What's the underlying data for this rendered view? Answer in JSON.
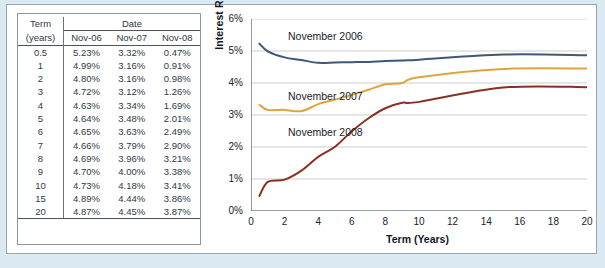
{
  "table": {
    "header": {
      "term": "Term",
      "term_units": "(years)",
      "group": "Date",
      "columns": [
        "Nov-06",
        "Nov-07",
        "Nov-08"
      ]
    },
    "rows": [
      {
        "term": "0.5",
        "nov06": "5.23%",
        "nov07": "3.32%",
        "nov08": "0.47%"
      },
      {
        "term": "1",
        "nov06": "4.99%",
        "nov07": "3.16%",
        "nov08": "0.91%"
      },
      {
        "term": "2",
        "nov06": "4.80%",
        "nov07": "3.16%",
        "nov08": "0.98%"
      },
      {
        "term": "3",
        "nov06": "4.72%",
        "nov07": "3.12%",
        "nov08": "1.26%"
      },
      {
        "term": "4",
        "nov06": "4.63%",
        "nov07": "3.34%",
        "nov08": "1.69%"
      },
      {
        "term": "5",
        "nov06": "4.64%",
        "nov07": "3.48%",
        "nov08": "2.01%"
      },
      {
        "term": "6",
        "nov06": "4.65%",
        "nov07": "3.63%",
        "nov08": "2.49%"
      },
      {
        "term": "7",
        "nov06": "4.66%",
        "nov07": "3.79%",
        "nov08": "2.90%"
      },
      {
        "term": "8",
        "nov06": "4.69%",
        "nov07": "3.96%",
        "nov08": "3.21%"
      },
      {
        "term": "9",
        "nov06": "4.70%",
        "nov07": "4.00%",
        "nov08": "3.38%"
      },
      {
        "term": "10",
        "nov06": "4.73%",
        "nov07": "4.18%",
        "nov08": "3.41%"
      },
      {
        "term": "15",
        "nov06": "4.89%",
        "nov07": "4.44%",
        "nov08": "3.86%"
      },
      {
        "term": "20",
        "nov06": "4.87%",
        "nov07": "4.45%",
        "nov08": "3.87%"
      }
    ]
  },
  "colors": {
    "nov06": "#3d5878",
    "nov07": "#e0a43c",
    "nov08": "#8b3020",
    "grid": "#c9cdd1",
    "axis": "#4b5560",
    "page_background": "#dbeaf2",
    "panel_background": "#ffffff"
  },
  "chart_data": {
    "type": "line",
    "title": "",
    "xlabel": "Term (Years)",
    "ylabel": "Interest Rate (EAR)",
    "xlim": [
      0,
      20
    ],
    "ylim": [
      0,
      6
    ],
    "xticks": [
      0,
      2,
      4,
      6,
      8,
      10,
      12,
      14,
      16,
      18,
      20
    ],
    "xticklabels": [
      "0",
      "2",
      "4",
      "6",
      "8",
      "10",
      "12",
      "14",
      "16",
      "18",
      "20"
    ],
    "yticks": [
      0,
      1,
      2,
      3,
      4,
      5,
      6
    ],
    "yticklabels": [
      "0%",
      "1%",
      "2%",
      "3%",
      "4%",
      "5%",
      "6%"
    ],
    "grid": "horizontal",
    "legend": "inline-annotations",
    "x": [
      0.5,
      1,
      2,
      3,
      4,
      5,
      6,
      7,
      8,
      9,
      10,
      15,
      20
    ],
    "series": [
      {
        "name": "November 2006",
        "color": "#3d5878",
        "label_x": 2.2,
        "label_y": 5.45,
        "values": [
          5.23,
          4.99,
          4.8,
          4.72,
          4.63,
          4.64,
          4.65,
          4.66,
          4.69,
          4.7,
          4.73,
          4.89,
          4.87
        ]
      },
      {
        "name": "November 2007",
        "color": "#e0a43c",
        "label_x": 2.2,
        "label_y": 3.55,
        "values": [
          3.32,
          3.16,
          3.16,
          3.12,
          3.34,
          3.48,
          3.63,
          3.79,
          3.96,
          4.0,
          4.18,
          4.44,
          4.45
        ]
      },
      {
        "name": "November 2008",
        "color": "#8b3020",
        "label_x": 2.2,
        "label_y": 2.45,
        "values": [
          0.47,
          0.91,
          0.98,
          1.26,
          1.69,
          2.01,
          2.49,
          2.9,
          3.21,
          3.38,
          3.41,
          3.86,
          3.87
        ]
      }
    ]
  }
}
